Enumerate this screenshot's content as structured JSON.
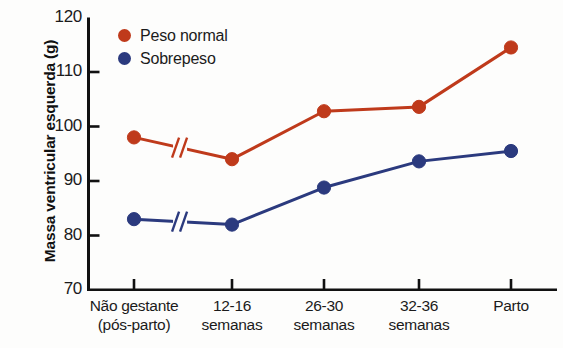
{
  "chart_data": {
    "type": "line",
    "title": "",
    "xlabel": "",
    "ylabel": "Massa ventricular esquerda (g)",
    "ylim": [
      70,
      120
    ],
    "yticks": [
      120,
      110,
      100,
      90,
      80,
      70
    ],
    "grid": false,
    "legend_position": "top-left",
    "categories": [
      "Não gestante\n(pós-parto)",
      "12-16\nsemanas",
      "26-30\nsemanas",
      "32-36\nsemanas",
      "Parto"
    ],
    "category_lines": [
      {
        "line1": "Não gestante",
        "line2": "(pós-parto)"
      },
      {
        "line1": "12-16",
        "line2": "semanas"
      },
      {
        "line1": "26-30",
        "line2": "semanas"
      },
      {
        "line1": "32-36",
        "line2": "semanas"
      },
      {
        "line1": "Parto",
        "line2": ""
      }
    ],
    "series": [
      {
        "name": "Peso normal",
        "color": "#BF3A1B",
        "values": [
          98.0,
          94.0,
          102.8,
          103.6,
          114.5
        ]
      },
      {
        "name": "Sobrepeso",
        "color": "#2B3A7E",
        "values": [
          83.0,
          82.0,
          88.8,
          93.6,
          95.5
        ]
      }
    ],
    "annotations": [
      {
        "type": "axis-break",
        "label": "//",
        "between_categories": [
          0,
          1
        ],
        "applies_to": [
          "Peso normal",
          "Sobrepeso"
        ]
      }
    ]
  },
  "axis": {
    "y_title": "Massa ventricular esquerda (g)",
    "y_tick_labels": [
      "120",
      "110",
      "100",
      "90",
      "80",
      "70"
    ],
    "colors": {
      "axis": "#111111",
      "normal_weight": "#BF3A1B",
      "overweight": "#2B3A7E"
    }
  },
  "legend": {
    "entries": [
      {
        "label": "Peso normal",
        "color": "#BF3A1B"
      },
      {
        "label": "Sobrepeso",
        "color": "#2B3A7E"
      }
    ]
  }
}
